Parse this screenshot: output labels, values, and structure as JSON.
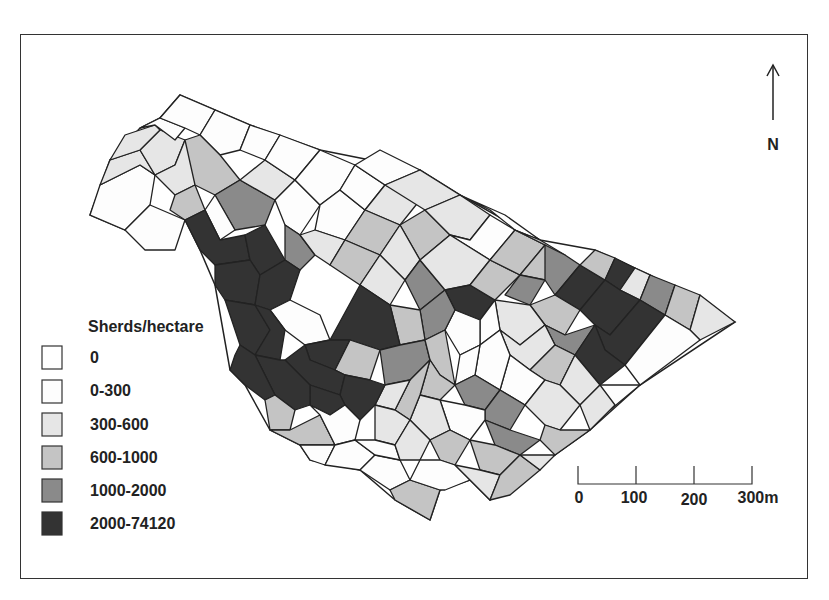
{
  "legend": {
    "title": "Sherds/hectare",
    "classes": [
      {
        "label": "0",
        "color": "#ffffff"
      },
      {
        "label": "0-300",
        "color": "#fdfdfd"
      },
      {
        "label": "300-600",
        "color": "#e6e6e6"
      },
      {
        "label": "600-1000",
        "color": "#c4c4c4"
      },
      {
        "label": "1000-2000",
        "color": "#8a8a8a"
      },
      {
        "label": "2000-74120",
        "color": "#333333"
      }
    ]
  },
  "north_arrow": {
    "label": "N"
  },
  "scale_bar": {
    "ticks": [
      "0",
      "100",
      "200",
      "300m"
    ]
  },
  "parcels": [
    {
      "pts": "90,215 100,185 140,165 155,175 150,205 125,230",
      "c": 1
    },
    {
      "pts": "125,230 150,205 185,220 175,250 145,250",
      "c": 1
    },
    {
      "pts": "100,185 110,160 140,150 155,175 140,165",
      "c": 2
    },
    {
      "pts": "140,150 160,130 185,140 175,165 155,175",
      "c": 2
    },
    {
      "pts": "110,160 125,135 155,125 160,130 140,150",
      "c": 2
    },
    {
      "pts": "140,128 160,118 185,128 175,140 155,125",
      "c": 1
    },
    {
      "pts": "160,118 180,95 215,110 200,135 185,128",
      "c": 1
    },
    {
      "pts": "155,175 175,165 185,140 200,150 195,185 175,195",
      "c": 2
    },
    {
      "pts": "175,195 195,185 205,210 185,220 170,210",
      "c": 3
    },
    {
      "pts": "200,135 215,110 250,125 240,150 220,155",
      "c": 1
    },
    {
      "pts": "185,140 200,135 220,155 240,180 215,195 195,185",
      "c": 3
    },
    {
      "pts": "240,150 250,125 280,135 265,160",
      "c": 1
    },
    {
      "pts": "215,195 240,180 275,200 265,225 235,230",
      "c": 4
    },
    {
      "pts": "240,180 265,160 295,180 275,200",
      "c": 2
    },
    {
      "pts": "265,160 280,135 320,150 295,180",
      "c": 1
    },
    {
      "pts": "205,210 215,195 235,230 220,240",
      "c": 1
    },
    {
      "pts": "185,220 205,210 220,240 245,235 250,260 215,265 200,250",
      "c": 5
    },
    {
      "pts": "245,235 265,225 285,260 260,275 250,260",
      "c": 5
    },
    {
      "pts": "275,200 295,180 320,205 300,235 285,225",
      "c": 1
    },
    {
      "pts": "285,225 300,235 315,255 300,270 285,260",
      "c": 4
    },
    {
      "pts": "215,265 250,260 260,275 255,305 225,300 215,285",
      "c": 5
    },
    {
      "pts": "260,275 285,260 300,270 290,300 270,310 255,305",
      "c": 5
    },
    {
      "pts": "270,310 290,300 320,315 330,340 305,345 285,330",
      "c": 1
    },
    {
      "pts": "225,300 255,305 270,330 255,355 240,345",
      "c": 5
    },
    {
      "pts": "255,305 270,310 285,330 280,360 255,355 270,330",
      "c": 5
    },
    {
      "pts": "295,180 320,150 355,165 340,190 320,205",
      "c": 1
    },
    {
      "pts": "320,205 340,190 365,210 345,240 315,230",
      "c": 1
    },
    {
      "pts": "300,235 315,230 345,240 330,265 315,255",
      "c": 2
    },
    {
      "pts": "340,190 355,165 385,185 365,210",
      "c": 1
    },
    {
      "pts": "355,165 380,150 420,170 385,185",
      "c": 1
    },
    {
      "pts": "365,210 385,185 420,200 400,225",
      "c": 2
    },
    {
      "pts": "345,240 365,210 400,225 380,255",
      "c": 3
    },
    {
      "pts": "330,265 345,240 380,255 360,285",
      "c": 3
    },
    {
      "pts": "385,185 420,170 460,195 425,210",
      "c": 2
    },
    {
      "pts": "400,225 425,210 450,235 420,260",
      "c": 3
    },
    {
      "pts": "380,255 400,225 420,260 405,280",
      "c": 2
    },
    {
      "pts": "405,280 420,260 445,290 420,310",
      "c": 4
    },
    {
      "pts": "360,285 380,255 405,280 390,305",
      "c": 2
    },
    {
      "pts": "425,210 460,195 490,215 470,240 450,235",
      "c": 2
    },
    {
      "pts": "450,235 470,240 490,215 515,230 490,260",
      "c": 1
    },
    {
      "pts": "420,260 450,235 490,260 470,285 445,290",
      "c": 2
    },
    {
      "pts": "460,195 490,210 515,230 540,240 505,215",
      "c": 1
    },
    {
      "pts": "445,290 470,285 495,300 480,320 455,310",
      "c": 5
    },
    {
      "pts": "470,285 490,260 520,275 495,300",
      "c": 3
    },
    {
      "pts": "490,260 515,230 545,245 520,275",
      "c": 3
    },
    {
      "pts": "515,230 540,240 565,255 545,280 520,275 545,245",
      "c": 3
    },
    {
      "pts": "520,275 545,280 530,305 505,295",
      "c": 4
    },
    {
      "pts": "545,245 565,255 580,265 555,295 545,280",
      "c": 4
    },
    {
      "pts": "555,295 580,265 605,280 580,310",
      "c": 5
    },
    {
      "pts": "580,265 605,280 615,258 595,250",
      "c": 3
    },
    {
      "pts": "605,280 615,258 635,268 620,290",
      "c": 5
    },
    {
      "pts": "620,290 635,268 650,275 640,300",
      "c": 2
    },
    {
      "pts": "640,300 650,275 675,285 665,315",
      "c": 4
    },
    {
      "pts": "665,315 675,285 700,295 690,330",
      "c": 3
    },
    {
      "pts": "690,330 700,295 735,322 700,340",
      "c": 2
    },
    {
      "pts": "580,310 605,280 620,290 640,300 610,335 595,325",
      "c": 5
    },
    {
      "pts": "595,325 610,335 640,300 665,315 625,365 605,350",
      "c": 5
    },
    {
      "pts": "530,305 555,295 580,310 565,335 545,325",
      "c": 3
    },
    {
      "pts": "545,325 565,335 595,325 575,355 555,345",
      "c": 4
    },
    {
      "pts": "575,355 595,325 605,350 625,365 600,385",
      "c": 5
    },
    {
      "pts": "625,365 665,315 690,330 700,340 640,385",
      "c": 1
    },
    {
      "pts": "495,300 530,305 545,325 520,345 500,330",
      "c": 2
    },
    {
      "pts": "480,320 495,300 500,330 480,345",
      "c": 1
    },
    {
      "pts": "455,310 480,320 480,345 460,355 445,330",
      "c": 1
    },
    {
      "pts": "500,330 520,345 545,325 555,345 530,370 510,355",
      "c": 2
    },
    {
      "pts": "530,370 555,345 575,355 560,385 545,380",
      "c": 3
    },
    {
      "pts": "560,385 575,355 600,385 580,405",
      "c": 2
    },
    {
      "pts": "600,385 640,385 610,410 590,405",
      "c": 1
    },
    {
      "pts": "580,405 600,385 615,405 590,430",
      "c": 2
    },
    {
      "pts": "510,355 530,370 545,380 525,405 500,390",
      "c": 1
    },
    {
      "pts": "525,405 545,380 560,385 580,405 560,430 545,425",
      "c": 2
    },
    {
      "pts": "545,425 560,430 590,430 555,455 540,440",
      "c": 3
    },
    {
      "pts": "480,345 500,330 510,355 500,390 475,375",
      "c": 1
    },
    {
      "pts": "460,355 480,345 475,375 455,385",
      "c": 1
    },
    {
      "pts": "420,310 445,290 455,310 445,330 425,340",
      "c": 4
    },
    {
      "pts": "390,305 420,310 425,340 400,345",
      "c": 3
    },
    {
      "pts": "330,340 360,285 390,305 400,345 380,350 350,340",
      "c": 5
    },
    {
      "pts": "305,345 330,340 350,340 335,370 310,360",
      "c": 5
    },
    {
      "pts": "350,340 380,350 370,380 345,375 335,370",
      "c": 3
    },
    {
      "pts": "380,350 400,345 425,340 430,360 410,380 385,385",
      "c": 4
    },
    {
      "pts": "425,340 445,330 455,385 440,375 430,360",
      "c": 3
    },
    {
      "pts": "430,360 440,375 455,385 440,400 420,395",
      "c": 3
    },
    {
      "pts": "455,385 475,375 500,390 485,410 465,405",
      "c": 4
    },
    {
      "pts": "500,390 525,405 510,430 485,420 485,410",
      "c": 4
    },
    {
      "pts": "485,420 510,430 540,440 520,455 495,445",
      "c": 4
    },
    {
      "pts": "440,400 465,405 485,410 485,420 470,440 450,430",
      "c": 1
    },
    {
      "pts": "420,395 440,400 450,430 430,440 410,420",
      "c": 2
    },
    {
      "pts": "410,380 430,360 420,395 410,420 395,410",
      "c": 3
    },
    {
      "pts": "385,385 410,380 395,410 375,405",
      "c": 2
    },
    {
      "pts": "285,360 305,345 310,360 335,370 345,375 340,395 310,385",
      "c": 5
    },
    {
      "pts": "345,375 370,380 385,385 375,405 360,420 345,405 340,395",
      "c": 5
    },
    {
      "pts": "310,385 340,395 345,405 330,415 310,405",
      "c": 5
    },
    {
      "pts": "255,355 280,360 285,360 310,385 310,405 295,410 275,395",
      "c": 5
    },
    {
      "pts": "240,345 255,355 275,395 265,400 245,385 230,370 235,355",
      "c": 5
    },
    {
      "pts": "265,400 275,395 295,410 290,430 270,430",
      "c": 3
    },
    {
      "pts": "270,430 290,430 320,415 335,445 300,445",
      "c": 3
    },
    {
      "pts": "310,405 330,415 345,405 360,420 355,440 335,445 320,415",
      "c": 1
    },
    {
      "pts": "300,445 335,445 325,465 310,460",
      "c": 1
    },
    {
      "pts": "325,465 335,445 355,440 375,455 360,470",
      "c": 1
    },
    {
      "pts": "360,470 375,455 400,460 410,480 390,490",
      "c": 1
    },
    {
      "pts": "390,490 410,480 440,490 430,520 395,500",
      "c": 3
    },
    {
      "pts": "375,405 395,410 410,420 395,445 375,440",
      "c": 2
    },
    {
      "pts": "355,440 375,440 395,445 400,460 375,455",
      "c": 1
    },
    {
      "pts": "395,445 410,420 430,440 420,460 400,460",
      "c": 2
    },
    {
      "pts": "430,440 450,430 470,440 455,465 440,460",
      "c": 3
    },
    {
      "pts": "420,460 440,460 455,465 470,480 445,490 440,490 410,480",
      "c": 1
    },
    {
      "pts": "470,440 495,445 520,455 500,475 480,470",
      "c": 3
    },
    {
      "pts": "455,465 480,470 500,475 490,500 470,480",
      "c": 2
    },
    {
      "pts": "490,500 500,475 520,455 540,470 510,495",
      "c": 3
    },
    {
      "pts": "520,455 555,455 540,470",
      "c": 2
    }
  ]
}
